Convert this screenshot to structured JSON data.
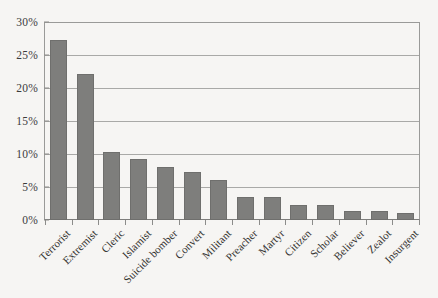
{
  "chart_data": {
    "type": "bar",
    "title": "",
    "subtitle": "",
    "xlabel": "",
    "ylabel": "",
    "ylim": [
      0,
      30
    ],
    "ytick_labels": [
      "0%",
      "5%",
      "10%",
      "15%",
      "20%",
      "25%",
      "30%"
    ],
    "ytick_values": [
      0,
      5,
      10,
      15,
      20,
      25,
      30
    ],
    "grid": true,
    "legend": "none",
    "value_suffix": "%",
    "bar_color": "#7e7e7c",
    "categories": [
      "Terrorist",
      "Extremist",
      "Cleric",
      "Islamist",
      "Suicide bomber",
      "Convert",
      "Militant",
      "Preacher",
      "Martyr",
      "Citizen",
      "Scholar",
      "Believer",
      "Zealot",
      "Insurgent"
    ],
    "values": [
      27.2,
      22.1,
      10.3,
      9.2,
      8.0,
      7.2,
      6.1,
      3.5,
      3.5,
      2.3,
      2.2,
      1.4,
      1.3,
      1.1
    ]
  }
}
